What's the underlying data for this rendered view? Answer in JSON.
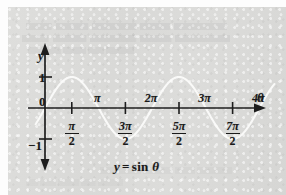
{
  "figure": {
    "caption_y": "y",
    "caption_equals": "=",
    "caption_fn": "sin",
    "caption_theta": "θ",
    "panel_background": "#d9d9d7",
    "curve_color": "#fbfbfa",
    "axis_color": "#1d1d1d"
  },
  "axes": {
    "y_axis_label": "y",
    "x_axis_label": "θ",
    "origin_label": "0",
    "y_tick_positive": "1",
    "y_tick_negative": "−1"
  },
  "x_ticks_above": [
    {
      "label": "π",
      "value": 3.14159
    },
    {
      "label": "2π",
      "value": 6.28319
    },
    {
      "label": "3π",
      "value": 9.42478
    },
    {
      "label": "4π",
      "value": 12.56637
    }
  ],
  "x_ticks_below": [
    {
      "numerator": "π",
      "denominator": "2",
      "value": 1.5708
    },
    {
      "numerator": "3π",
      "denominator": "2",
      "value": 4.71239
    },
    {
      "numerator": "5π",
      "denominator": "2",
      "value": 7.85398
    },
    {
      "numerator": "7π",
      "denominator": "2",
      "value": 10.99557
    }
  ],
  "chart_data": {
    "type": "line",
    "xlabel": "θ",
    "ylabel": "y",
    "grid": false,
    "legend": "none",
    "xlim": [
      -0.6,
      13.6
    ],
    "ylim": [
      -1.45,
      1.45
    ],
    "x_tick_labels": [
      "π/2",
      "π",
      "3π/2",
      "2π",
      "5π/2",
      "3π",
      "7π/2",
      "4π"
    ],
    "x_tick_values": [
      1.5708,
      3.14159,
      4.71239,
      6.28319,
      7.85398,
      9.42478,
      10.99557,
      12.56637
    ],
    "y_tick_labels": [
      "1",
      "0",
      "−1"
    ],
    "y_tick_values": [
      1,
      0,
      -1
    ],
    "series": [
      {
        "name": "y = sin θ",
        "function": "sin",
        "amplitude": 1,
        "period": 6.28319,
        "phase": 0,
        "x_start": -0.55,
        "x_end": 13.45,
        "color": "#fbfbfa",
        "zero_crossings": [
          0,
          3.14159,
          6.28319,
          9.42478,
          12.56637
        ],
        "maxima_x": [
          1.5708,
          7.85398
        ],
        "maxima_y": [
          1,
          1
        ],
        "minima_x": [
          4.71239,
          10.99557
        ],
        "minima_y": [
          -1,
          -1
        ]
      }
    ]
  }
}
